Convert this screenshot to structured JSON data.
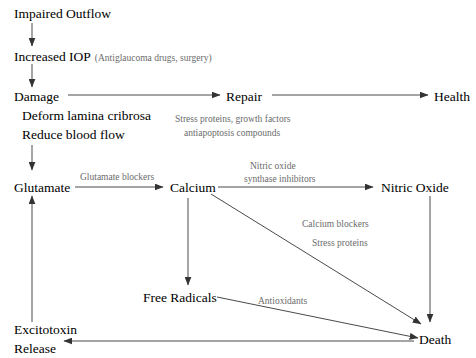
{
  "diagram": {
    "background_color": "#ffffff",
    "node_color": "#000000",
    "annotation_color": "#6b6b6b",
    "edge_color": "#4a4a4a",
    "nodes": [
      {
        "id": "impaired_outflow",
        "label": "Impaired Outflow"
      },
      {
        "id": "increased_iop",
        "label": "Increased IOP"
      },
      {
        "id": "damage",
        "label": "Damage"
      },
      {
        "id": "damage_detail_1",
        "label": "Deform lamina cribrosa"
      },
      {
        "id": "damage_detail_2",
        "label": "Reduce blood flow"
      },
      {
        "id": "repair",
        "label": "Repair"
      },
      {
        "id": "health",
        "label": "Health"
      },
      {
        "id": "glutamate",
        "label": "Glutamate"
      },
      {
        "id": "calcium",
        "label": "Calcium"
      },
      {
        "id": "nitric_oxide",
        "label": "Nitric Oxide"
      },
      {
        "id": "free_radicals",
        "label": "Free Radicals"
      },
      {
        "id": "excitotoxin_release_1",
        "label": "Excitotoxin"
      },
      {
        "id": "excitotoxin_release_2",
        "label": "Release"
      },
      {
        "id": "death",
        "label": "Death"
      }
    ],
    "annotations": [
      {
        "id": "iop_treatment",
        "label": "(Antiglaucoma drugs, surgery)"
      },
      {
        "id": "repair_agents_line1",
        "label": "Stress proteins, growth factors"
      },
      {
        "id": "repair_agents_line2",
        "label": "antiapoptosis compounds"
      },
      {
        "id": "glutamate_blockers",
        "label": "Glutamate blockers"
      },
      {
        "id": "nos_inhibitors_line1",
        "label": "Nitric oxide"
      },
      {
        "id": "nos_inhibitors_line2",
        "label": "synthase inhibitors"
      },
      {
        "id": "calcium_blockers",
        "label": "Calcium blockers"
      },
      {
        "id": "stress_proteins",
        "label": "Stress proteins"
      },
      {
        "id": "antioxidants",
        "label": "Antioxidants"
      }
    ],
    "edges": [
      {
        "id": "impaired-to-iop",
        "from": "impaired_outflow",
        "to": "increased_iop",
        "direction": "down"
      },
      {
        "id": "iop-to-damage",
        "from": "increased_iop",
        "to": "damage",
        "direction": "down"
      },
      {
        "id": "damage-to-repair",
        "from": "damage",
        "to": "repair",
        "direction": "right"
      },
      {
        "id": "repair-to-health",
        "from": "repair",
        "to": "health",
        "direction": "right"
      },
      {
        "id": "damage-to-glutamate",
        "from": "damage",
        "to": "glutamate",
        "direction": "down"
      },
      {
        "id": "glutamate-to-calcium",
        "from": "glutamate",
        "to": "calcium",
        "direction": "right"
      },
      {
        "id": "calcium-to-nitric-oxide",
        "from": "calcium",
        "to": "nitric_oxide",
        "direction": "right"
      },
      {
        "id": "calcium-to-free-radicals",
        "from": "calcium",
        "to": "free_radicals",
        "direction": "down"
      },
      {
        "id": "calcium-to-death",
        "from": "calcium",
        "to": "death",
        "direction": "diagonal-down-right"
      },
      {
        "id": "nitric-oxide-to-death",
        "from": "nitric_oxide",
        "to": "death",
        "direction": "down"
      },
      {
        "id": "free-radicals-to-death",
        "from": "free_radicals",
        "to": "death",
        "direction": "diagonal-down-right"
      },
      {
        "id": "death-to-excitotoxin",
        "from": "death",
        "to": "excitotoxin_release_2",
        "direction": "left"
      },
      {
        "id": "excitotoxin-to-glutamate",
        "from": "excitotoxin_release_1",
        "to": "glutamate",
        "direction": "up"
      }
    ]
  }
}
